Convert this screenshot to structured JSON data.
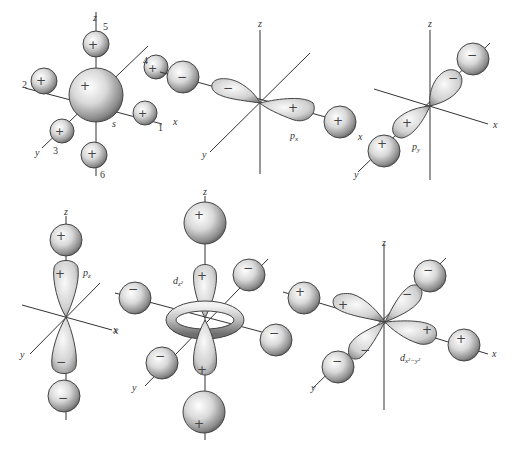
{
  "figure": {
    "panels": [
      {
        "id": "s",
        "orbital_label": "s",
        "axes": {
          "x": "x",
          "y": "y",
          "z": "z"
        },
        "central_sign": "+",
        "ligands": [
          {
            "number": "1",
            "sign": "+"
          },
          {
            "number": "2",
            "sign": "+"
          },
          {
            "number": "3",
            "sign": "+"
          },
          {
            "number": "4",
            "sign": "+"
          },
          {
            "number": "5",
            "sign": "+"
          },
          {
            "number": "6",
            "sign": "+"
          }
        ]
      },
      {
        "id": "px",
        "orbital_label": "p",
        "orbital_subscript": "x",
        "axes": {
          "x": "x",
          "y": "y",
          "z": "z"
        },
        "lobe_signs": [
          "−",
          "+"
        ],
        "ligand_signs": [
          "−",
          "+"
        ]
      },
      {
        "id": "py",
        "orbital_label": "p",
        "orbital_subscript": "y",
        "axes": {
          "x": "x",
          "y": "y",
          "z": "z"
        },
        "lobe_signs": [
          "−",
          "+"
        ],
        "ligand_signs": [
          "−",
          "+"
        ]
      },
      {
        "id": "pz",
        "orbital_label": "p",
        "orbital_subscript": "z",
        "axes": {
          "x": "x",
          "y": "y",
          "z": "z"
        },
        "lobe_signs": [
          "+",
          "−"
        ],
        "ligand_signs": [
          "+",
          "−"
        ]
      },
      {
        "id": "dz2",
        "orbital_label": "d",
        "orbital_subscript": "z²",
        "axes": {
          "x": "x",
          "y": "y",
          "z": "z"
        },
        "lobe_signs": [
          "+",
          "+"
        ],
        "ring_sign": "−",
        "ligand_signs": {
          "top": "+",
          "bottom": "+",
          "left": "−",
          "right": "−",
          "back": "−",
          "front": "−"
        }
      },
      {
        "id": "dx2-y2",
        "orbital_label": "d",
        "orbital_subscript": "x²−y²",
        "axes": {
          "x": "x",
          "y": "y",
          "z": "z"
        },
        "lobe_signs": {
          "left_x": "+",
          "right_x": "+",
          "back_y": "−",
          "front_y": "−"
        },
        "ligand_signs": {
          "left_x": "+",
          "right_x": "+",
          "back_y": "−",
          "front_y": "−"
        }
      }
    ]
  }
}
